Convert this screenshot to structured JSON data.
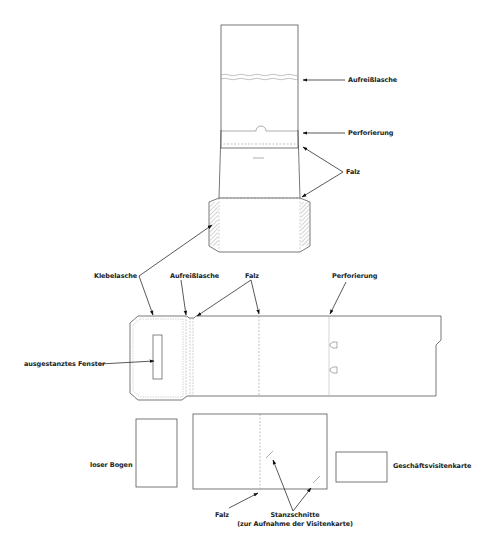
{
  "diagram": {
    "labels": {
      "top_aufreisslasche": "Aufreißlasche",
      "top_perforierung": "Perforierung",
      "top_falz": "Falz",
      "klebelasche": "Klebelasche",
      "mid_aufreisslasche": "Aufreißlasche",
      "mid_falz": "Falz",
      "mid_perforierung": "Perforierung",
      "fenster": "ausgestanztes Fenster",
      "loser_bogen": "loser Bogen",
      "bottom_falz": "Falz",
      "stanzschnitte": "Stanzschnitte",
      "stanzschnitte_note": "(zur Aufnahme der Visitenkarte)",
      "visitenkarte": "Geschäftsvisitenkarte"
    },
    "colors": {
      "line": "#555555",
      "dashed": "#999999",
      "arrow": "#111111",
      "hatch": "#bbbbbb"
    }
  }
}
